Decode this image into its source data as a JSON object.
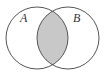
{
  "diagram": {
    "type": "venn",
    "shaded_region": "intersection",
    "sets": [
      {
        "label": "A",
        "cx": 37,
        "cy": 38,
        "r": 31,
        "label_x": 20,
        "label_y": 22
      },
      {
        "label": "B",
        "cx": 68,
        "cy": 38,
        "r": 31,
        "label_x": 73,
        "label_y": 22
      }
    ],
    "colors": {
      "background": "#ffffff",
      "outline": "#555555",
      "shade": "#c8c8c8"
    }
  }
}
